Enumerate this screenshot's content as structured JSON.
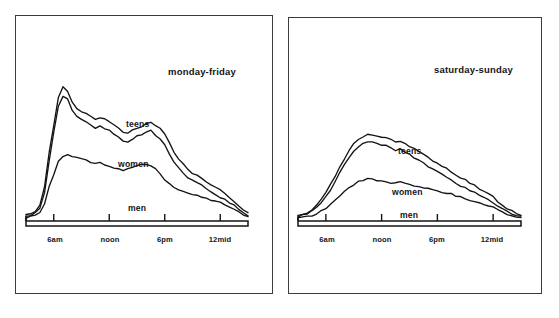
{
  "figure": {
    "background_color": "#ffffff",
    "ink_color": "#141418",
    "panel_border_color": "#3b3b42"
  },
  "panels": [
    {
      "name": "weekday",
      "title": "monday-friday",
      "axis_ticks": [
        "6am",
        "noon",
        "6pm",
        "12mid"
      ],
      "series_labels": [
        "teens",
        "women",
        "men"
      ]
    },
    {
      "name": "weekend",
      "title": "saturday-sunday",
      "axis_ticks": [
        "6am",
        "noon",
        "6pm",
        "12mid"
      ],
      "series_labels": [
        "teens",
        "women",
        "men"
      ]
    }
  ],
  "chart_data": [
    {
      "type": "line",
      "title": "monday-friday",
      "xlabel": "",
      "ylabel": "",
      "grid": false,
      "legend_position": "inline-labels",
      "xlim": [
        3,
        27
      ],
      "ylim": [
        0,
        100
      ],
      "x_tick_values": [
        6,
        12,
        18,
        24
      ],
      "x_tick_labels": [
        "6am",
        "noon",
        "6pm",
        "12mid"
      ],
      "x": [
        3,
        3.5,
        4,
        4.5,
        5,
        5.5,
        6,
        6.5,
        7,
        7.5,
        8,
        8.5,
        9,
        9.5,
        10,
        10.5,
        11,
        11.5,
        12,
        12.5,
        13,
        13.5,
        14,
        14.5,
        15,
        15.5,
        16,
        16.5,
        17,
        17.5,
        18,
        18.5,
        19,
        19.5,
        20,
        20.5,
        21,
        21.5,
        22,
        22.5,
        23,
        23.5,
        24,
        24.5,
        25,
        25.5,
        26,
        26.5,
        27
      ],
      "series": [
        {
          "name": "teens",
          "values": [
            4,
            5,
            7,
            11,
            24,
            48,
            68,
            88,
            95,
            92,
            84,
            80,
            78,
            76,
            74,
            72,
            73,
            72,
            70,
            68,
            66,
            63,
            62,
            64,
            66,
            67,
            69,
            70,
            68,
            66,
            62,
            56,
            49,
            44,
            40,
            37,
            34,
            32,
            30,
            28,
            26,
            24,
            22,
            20,
            17,
            14,
            11,
            8,
            6
          ]
        },
        {
          "name": "women",
          "values": [
            3,
            4,
            6,
            9,
            20,
            43,
            63,
            82,
            89,
            86,
            78,
            74,
            72,
            70,
            68,
            66,
            67,
            66,
            64,
            62,
            60,
            57,
            56,
            58,
            60,
            61,
            63,
            64,
            61,
            58,
            54,
            48,
            42,
            38,
            34,
            31,
            29,
            27,
            25,
            23,
            21,
            19,
            17,
            15,
            13,
            11,
            8,
            6,
            4
          ]
        },
        {
          "name": "men",
          "values": [
            2,
            3,
            4,
            6,
            12,
            24,
            33,
            42,
            46,
            47,
            46,
            45,
            44,
            43,
            42,
            41,
            41,
            40,
            39,
            38,
            37,
            36,
            37,
            38,
            39,
            40,
            40,
            39,
            37,
            33,
            29,
            26,
            24,
            22,
            21,
            20,
            19,
            18,
            17,
            16,
            15,
            14,
            13,
            12,
            10,
            8,
            6,
            4,
            3
          ]
        }
      ]
    },
    {
      "type": "line",
      "title": "saturday-sunday",
      "xlabel": "",
      "ylabel": "",
      "grid": false,
      "legend_position": "inline-labels",
      "xlim": [
        3,
        27
      ],
      "ylim": [
        0,
        100
      ],
      "x_tick_values": [
        6,
        12,
        18,
        24
      ],
      "x_tick_labels": [
        "6am",
        "noon",
        "6pm",
        "12mid"
      ],
      "x": [
        3,
        3.5,
        4,
        4.5,
        5,
        5.5,
        6,
        6.5,
        7,
        7.5,
        8,
        8.5,
        9,
        9.5,
        10,
        10.5,
        11,
        11.5,
        12,
        12.5,
        13,
        13.5,
        14,
        14.5,
        15,
        15.5,
        16,
        16.5,
        17,
        17.5,
        18,
        18.5,
        19,
        19.5,
        20,
        20.5,
        21,
        21.5,
        22,
        22.5,
        23,
        23.5,
        24,
        24.5,
        25,
        25.5,
        26,
        26.5,
        27
      ],
      "series": [
        {
          "name": "teens",
          "values": [
            4,
            5,
            6,
            8,
            11,
            15,
            20,
            26,
            32,
            38,
            44,
            50,
            55,
            58,
            60,
            61,
            61,
            60,
            59,
            59,
            58,
            56,
            57,
            55,
            53,
            51,
            49,
            47,
            45,
            43,
            41,
            39,
            37,
            35,
            33,
            31,
            29,
            27,
            25,
            23,
            21,
            19,
            17,
            14,
            11,
            9,
            7,
            5,
            4
          ]
        },
        {
          "name": "women",
          "values": [
            3,
            4,
            5,
            7,
            10,
            13,
            17,
            22,
            28,
            34,
            40,
            45,
            50,
            53,
            55,
            56,
            56,
            55,
            54,
            54,
            52,
            50,
            51,
            49,
            47,
            45,
            43,
            41,
            39,
            37,
            35,
            33,
            31,
            29,
            27,
            25,
            24,
            22,
            20,
            18,
            17,
            15,
            13,
            11,
            9,
            7,
            5,
            4,
            3
          ]
        },
        {
          "name": "men",
          "values": [
            2,
            3,
            3,
            4,
            5,
            7,
            9,
            12,
            15,
            18,
            21,
            24,
            26,
            28,
            29,
            30,
            30,
            29,
            29,
            28,
            27,
            27,
            28,
            27,
            26,
            25,
            25,
            24,
            23,
            22,
            21,
            20,
            19,
            19,
            18,
            17,
            16,
            15,
            14,
            13,
            12,
            11,
            10,
            8,
            7,
            5,
            4,
            3,
            2
          ]
        }
      ]
    }
  ]
}
